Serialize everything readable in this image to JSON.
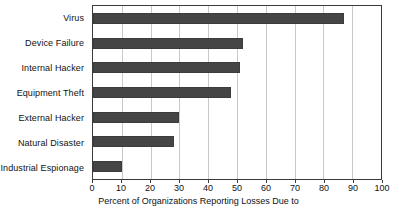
{
  "chart_data": {
    "type": "bar",
    "orientation": "horizontal",
    "title": "",
    "xlabel": "Percent of Organizations Reporting Losses Due to",
    "ylabel": "",
    "categories": [
      "Virus",
      "Device Failure",
      "Internal Hacker",
      "Equipment Theft",
      "External Hacker",
      "Natural Disaster",
      "Industrial Espionage"
    ],
    "values": [
      87,
      52,
      51,
      48,
      30,
      28,
      10
    ],
    "xlim": [
      0,
      100
    ],
    "xticks": [
      0,
      10,
      20,
      30,
      40,
      50,
      60,
      70,
      80,
      90,
      100
    ],
    "xtick_labels": [
      "0",
      "10",
      "20",
      "30",
      "40",
      "50",
      "60",
      "70",
      "80",
      "90",
      "100"
    ],
    "grid": "vertical",
    "legend": "none",
    "bar_color": "#454545",
    "gridline_color": "#c8c8c8",
    "axis_color": "#3a3a3a",
    "background_color": "#ffffff"
  }
}
